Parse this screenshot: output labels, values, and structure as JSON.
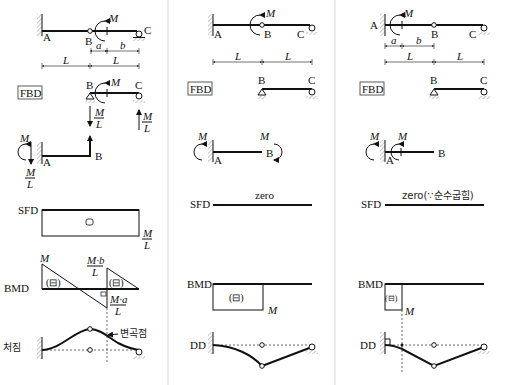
{
  "labels": {
    "fbd": "FBD",
    "sfd": "SFD",
    "bmd": "BMD",
    "dd": "DD",
    "deflection_kr": "처짐",
    "inflection_kr": "변곡점",
    "zero": "zero",
    "zero_pure_bending": "zero(∵순수굽힘)",
    "sign_symbol": "(⊟)"
  },
  "points": {
    "A": "A",
    "B": "B",
    "C": "C"
  },
  "symbols": {
    "M": "M",
    "L": "L",
    "a": "a",
    "b": "b",
    "M_over_L_num": "M",
    "M_over_L_den": "L",
    "Mb_num": "M·b",
    "Ma_num": "M·a"
  },
  "columns": [
    {
      "case": "moment M applied at distance a right of hinge B (in span BC)"
    },
    {
      "case": "moment M applied at hinge B"
    },
    {
      "case": "moment M applied at distance a right of fixed support A (in span AB)"
    }
  ]
}
